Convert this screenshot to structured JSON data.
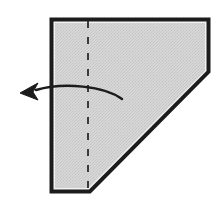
{
  "figure": {
    "title": "Paper folding diagram",
    "background_color": "#ffffff",
    "paper": {
      "label": "paper-sheet",
      "fill_color": "#d2d2d2",
      "fill_texture": "halftone-dots",
      "border_color": "#1c1c1c",
      "border_width": 3,
      "inner_highlight_color": "#f2f2f2",
      "shape": "pentagon",
      "vertices": [
        [
          51,
          19
        ],
        [
          209,
          19
        ],
        [
          209,
          72
        ],
        [
          90,
          192
        ],
        [
          51,
          192
        ]
      ]
    },
    "fold_line": {
      "label": "fold-crease",
      "style": "dashed",
      "color": "#3a3a3a",
      "width": 2,
      "dash_pattern": "7 9",
      "x": 88,
      "y_start": 19,
      "y_end": 192
    },
    "fold_arrow": {
      "label": "fold-direction-arrow",
      "color": "#1c1c1c",
      "direction": "left",
      "shaft_path": "M 122 99 C 104 86, 64 82, 36 90",
      "tip": [
        20,
        93
      ],
      "head_points": "20,93 38,83 33,92 38,100"
    }
  }
}
